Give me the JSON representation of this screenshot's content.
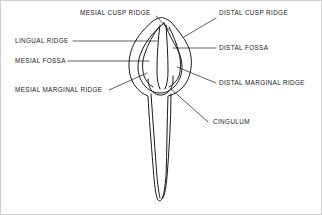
{
  "figure": {
    "ink_color": "#1a1a1a",
    "background_color": "#ffffff",
    "border_color": "#cfcfcf"
  },
  "labels": {
    "mesial_cusp_ridge": "MESIAL CUSP RIDGE",
    "distal_cusp_ridge": "DISTAL CUSP RIDGE",
    "lingual_ridge": "LINGUAL RIDGE",
    "distal_fossa": "DISTAL FOSSA",
    "mesial_fossa": "MESIAL FOSSA",
    "distal_marginal_ridge": "DISTAL MARGINAL RIDGE",
    "mesial_marginal_ridge": "MESIAL MARGINAL RIDGE",
    "cingulum": "CINGULUM"
  }
}
